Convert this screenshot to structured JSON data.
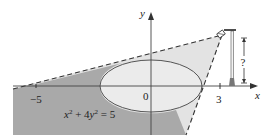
{
  "figure": {
    "type": "diagram",
    "equation_label": {
      "base1": "x",
      "sup1": "2",
      "mid": " + 4",
      "base2": "y",
      "sup2": "2",
      "tail": " = 5"
    },
    "axes": {
      "x_label": "x",
      "y_label": "y",
      "origin_label": "0",
      "ticks": [
        {
          "value": -5,
          "label": "−5"
        },
        {
          "value": 3,
          "label": "3"
        }
      ]
    },
    "height_label": "?",
    "colors": {
      "shadow": "#a9a9a9",
      "light_cone": "#e6e6e6",
      "ellipse_fill": "#e9e9e9",
      "stroke": "#444444"
    }
  }
}
